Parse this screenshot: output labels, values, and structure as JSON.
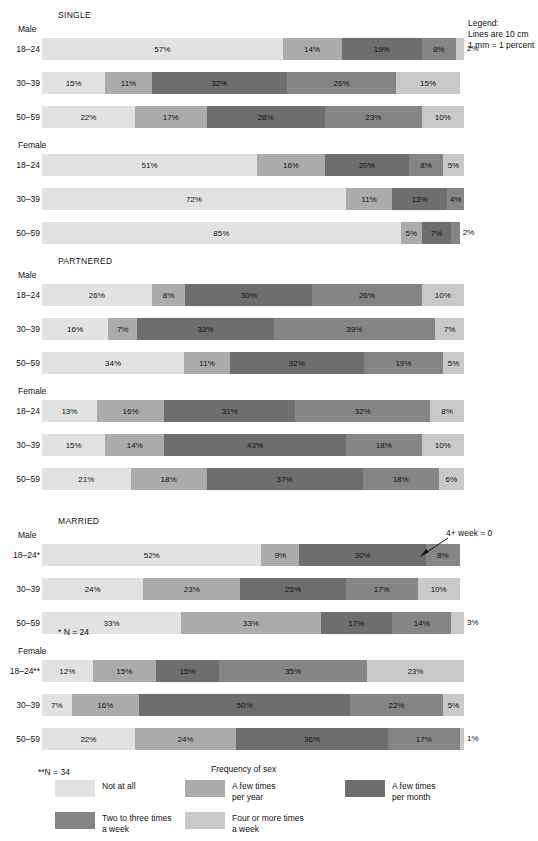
{
  "legend_note": {
    "line1": "Legend:",
    "line2": "Lines are 10 cm",
    "line3": "1 mm = 1 percent"
  },
  "axis_title": "Frequency of sex",
  "footnotes": {
    "male_married": "* N = 24",
    "female_married": "**N = 34"
  },
  "annotation": {
    "text": "4+ week = 0"
  },
  "colors": {
    "not_at_all": "#e2e2e2",
    "few_times_per_year": "#ababab",
    "few_times_per_month": "#6e6e6e",
    "two_to_three_week": "#858585",
    "four_or_more_week": "#c9c9c9"
  },
  "legend": {
    "items": [
      {
        "key": "not_at_all",
        "label": "Not at all"
      },
      {
        "key": "few_times_per_year",
        "label": "A few times\nper year"
      },
      {
        "key": "few_times_per_month",
        "label": "A few times\nper month"
      },
      {
        "key": "two_to_three_week",
        "label": "Two to three times\na week"
      },
      {
        "key": "four_or_more_week",
        "label": "Four or more times\na week"
      }
    ]
  },
  "sections": [
    {
      "title": "SINGLE",
      "subgroups": [
        {
          "sex": "Male",
          "rows": [
            {
              "label": "18–24",
              "segments": [
                {
                  "key": "not_at_all",
                  "value": 57,
                  "text": "57%"
                },
                {
                  "key": "few_times_per_year",
                  "value": 14,
                  "text": "14%"
                },
                {
                  "key": "few_times_per_month",
                  "value": 19,
                  "text": "19%"
                },
                {
                  "key": "two_to_three_week",
                  "value": 8,
                  "text": "8%"
                },
                {
                  "key": "four_or_more_week",
                  "value": 2,
                  "text": "2%"
                }
              ]
            },
            {
              "label": "30–39",
              "segments": [
                {
                  "key": "not_at_all",
                  "value": 15,
                  "text": "15%"
                },
                {
                  "key": "few_times_per_year",
                  "value": 11,
                  "text": "11%"
                },
                {
                  "key": "few_times_per_month",
                  "value": 32,
                  "text": "32%"
                },
                {
                  "key": "two_to_three_week",
                  "value": 26,
                  "text": "26%"
                },
                {
                  "key": "four_or_more_week",
                  "value": 15,
                  "text": "15%"
                }
              ]
            },
            {
              "label": "50–59",
              "segments": [
                {
                  "key": "not_at_all",
                  "value": 22,
                  "text": "22%"
                },
                {
                  "key": "few_times_per_year",
                  "value": 17,
                  "text": "17%"
                },
                {
                  "key": "few_times_per_month",
                  "value": 28,
                  "text": "28%"
                },
                {
                  "key": "two_to_three_week",
                  "value": 23,
                  "text": "23%"
                },
                {
                  "key": "four_or_more_week",
                  "value": 10,
                  "text": "10%"
                }
              ]
            }
          ]
        },
        {
          "sex": "Female",
          "rows": [
            {
              "label": "18–24",
              "segments": [
                {
                  "key": "not_at_all",
                  "value": 51,
                  "text": "51%"
                },
                {
                  "key": "few_times_per_year",
                  "value": 16,
                  "text": "16%"
                },
                {
                  "key": "few_times_per_month",
                  "value": 20,
                  "text": "20%"
                },
                {
                  "key": "two_to_three_week",
                  "value": 8,
                  "text": "8%"
                },
                {
                  "key": "four_or_more_week",
                  "value": 5,
                  "text": "5%"
                }
              ]
            },
            {
              "label": "30–39",
              "segments": [
                {
                  "key": "not_at_all",
                  "value": 72,
                  "text": "72%"
                },
                {
                  "key": "few_times_per_year",
                  "value": 11,
                  "text": "11%"
                },
                {
                  "key": "few_times_per_month",
                  "value": 13,
                  "text": "13%"
                },
                {
                  "key": "two_to_three_week",
                  "value": 4,
                  "text": "4%"
                }
              ]
            },
            {
              "label": "50–59",
              "segments": [
                {
                  "key": "not_at_all",
                  "value": 85,
                  "text": "85%"
                },
                {
                  "key": "few_times_per_year",
                  "value": 5,
                  "text": "5%"
                },
                {
                  "key": "few_times_per_month",
                  "value": 7,
                  "text": "7%"
                },
                {
                  "key": "two_to_three_week",
                  "value": 2,
                  "text": "2%"
                }
              ]
            }
          ]
        }
      ]
    },
    {
      "title": "PARTNERED",
      "subgroups": [
        {
          "sex": "Male",
          "rows": [
            {
              "label": "18–24",
              "segments": [
                {
                  "key": "not_at_all",
                  "value": 26,
                  "text": "26%"
                },
                {
                  "key": "few_times_per_year",
                  "value": 8,
                  "text": "8%"
                },
                {
                  "key": "few_times_per_month",
                  "value": 30,
                  "text": "30%"
                },
                {
                  "key": "two_to_three_week",
                  "value": 26,
                  "text": "26%"
                },
                {
                  "key": "four_or_more_week",
                  "value": 10,
                  "text": "10%"
                }
              ]
            },
            {
              "label": "30–39",
              "segments": [
                {
                  "key": "not_at_all",
                  "value": 16,
                  "text": "16%"
                },
                {
                  "key": "few_times_per_year",
                  "value": 7,
                  "text": "7%"
                },
                {
                  "key": "few_times_per_month",
                  "value": 33,
                  "text": "33%"
                },
                {
                  "key": "two_to_three_week",
                  "value": 39,
                  "text": "39%"
                },
                {
                  "key": "four_or_more_week",
                  "value": 7,
                  "text": "7%"
                }
              ]
            },
            {
              "label": "50–59",
              "segments": [
                {
                  "key": "not_at_all",
                  "value": 34,
                  "text": "34%"
                },
                {
                  "key": "few_times_per_year",
                  "value": 11,
                  "text": "11%"
                },
                {
                  "key": "few_times_per_month",
                  "value": 32,
                  "text": "32%"
                },
                {
                  "key": "two_to_three_week",
                  "value": 19,
                  "text": "19%"
                },
                {
                  "key": "four_or_more_week",
                  "value": 5,
                  "text": "5%"
                }
              ]
            }
          ]
        },
        {
          "sex": "Female",
          "rows": [
            {
              "label": "18–24",
              "segments": [
                {
                  "key": "not_at_all",
                  "value": 13,
                  "text": "13%"
                },
                {
                  "key": "few_times_per_year",
                  "value": 16,
                  "text": "16%"
                },
                {
                  "key": "few_times_per_month",
                  "value": 31,
                  "text": "31%"
                },
                {
                  "key": "two_to_three_week",
                  "value": 32,
                  "text": "32%"
                },
                {
                  "key": "four_or_more_week",
                  "value": 8,
                  "text": "8%"
                }
              ]
            },
            {
              "label": "30–39",
              "segments": [
                {
                  "key": "not_at_all",
                  "value": 15,
                  "text": "15%"
                },
                {
                  "key": "few_times_per_year",
                  "value": 14,
                  "text": "14%"
                },
                {
                  "key": "few_times_per_month",
                  "value": 43,
                  "text": "43%"
                },
                {
                  "key": "two_to_three_week",
                  "value": 18,
                  "text": "18%"
                },
                {
                  "key": "four_or_more_week",
                  "value": 10,
                  "text": "10%"
                }
              ]
            },
            {
              "label": "50–59",
              "segments": [
                {
                  "key": "not_at_all",
                  "value": 21,
                  "text": "21%"
                },
                {
                  "key": "few_times_per_year",
                  "value": 18,
                  "text": "18%"
                },
                {
                  "key": "few_times_per_month",
                  "value": 37,
                  "text": "37%"
                },
                {
                  "key": "two_to_three_week",
                  "value": 18,
                  "text": "18%"
                },
                {
                  "key": "four_or_more_week",
                  "value": 6,
                  "text": "6%"
                }
              ]
            }
          ]
        }
      ]
    },
    {
      "title": "MARRIED",
      "subgroups": [
        {
          "sex": "Male",
          "rows": [
            {
              "label": "18–24*",
              "segments": [
                {
                  "key": "not_at_all",
                  "value": 52,
                  "text": "52%"
                },
                {
                  "key": "few_times_per_year",
                  "value": 9,
                  "text": "9%"
                },
                {
                  "key": "few_times_per_month",
                  "value": 30,
                  "text": "30%"
                },
                {
                  "key": "two_to_three_week",
                  "value": 8,
                  "text": "8%"
                }
              ]
            },
            {
              "label": "30–39",
              "segments": [
                {
                  "key": "not_at_all",
                  "value": 24,
                  "text": "24%"
                },
                {
                  "key": "few_times_per_year",
                  "value": 23,
                  "text": "23%"
                },
                {
                  "key": "few_times_per_month",
                  "value": 25,
                  "text": "25%"
                },
                {
                  "key": "two_to_three_week",
                  "value": 17,
                  "text": "17%"
                },
                {
                  "key": "four_or_more_week",
                  "value": 10,
                  "text": "10%"
                }
              ]
            },
            {
              "label": "50–59",
              "segments": [
                {
                  "key": "not_at_all",
                  "value": 33,
                  "text": "33%"
                },
                {
                  "key": "few_times_per_year",
                  "value": 33,
                  "text": "33%"
                },
                {
                  "key": "few_times_per_month",
                  "value": 17,
                  "text": "17%"
                },
                {
                  "key": "two_to_three_week",
                  "value": 14,
                  "text": "14%"
                },
                {
                  "key": "four_or_more_week",
                  "value": 3,
                  "text": "3%"
                }
              ]
            }
          ]
        },
        {
          "sex": "Female",
          "rows": [
            {
              "label": "18–24**",
              "segments": [
                {
                  "key": "not_at_all",
                  "value": 12,
                  "text": "12%"
                },
                {
                  "key": "few_times_per_year",
                  "value": 15,
                  "text": "15%"
                },
                {
                  "key": "few_times_per_month",
                  "value": 15,
                  "text": "15%"
                },
                {
                  "key": "two_to_three_week",
                  "value": 35,
                  "text": "35%"
                },
                {
                  "key": "four_or_more_week",
                  "value": 23,
                  "text": "23%"
                }
              ]
            },
            {
              "label": "30–39",
              "segments": [
                {
                  "key": "not_at_all",
                  "value": 7,
                  "text": "7%"
                },
                {
                  "key": "few_times_per_year",
                  "value": 16,
                  "text": "16%"
                },
                {
                  "key": "few_times_per_month",
                  "value": 50,
                  "text": "50%"
                },
                {
                  "key": "two_to_three_week",
                  "value": 22,
                  "text": "22%"
                },
                {
                  "key": "four_or_more_week",
                  "value": 5,
                  "text": "5%"
                }
              ]
            },
            {
              "label": "50–59",
              "segments": [
                {
                  "key": "not_at_all",
                  "value": 22,
                  "text": "22%"
                },
                {
                  "key": "few_times_per_year",
                  "value": 24,
                  "text": "24%"
                },
                {
                  "key": "few_times_per_month",
                  "value": 36,
                  "text": "36%"
                },
                {
                  "key": "two_to_three_week",
                  "value": 17,
                  "text": "17%"
                },
                {
                  "key": "four_or_more_week",
                  "value": 1,
                  "text": "1%"
                }
              ]
            }
          ]
        }
      ]
    }
  ],
  "chart_data": {
    "type": "bar",
    "title": "",
    "xlabel": "Frequency of sex",
    "ylabel": "",
    "orientation": "horizontal",
    "stacked": true,
    "xlim": [
      0,
      100
    ],
    "grid": false,
    "legend_position": "bottom",
    "categories": [
      "SINGLE / Male / 18-24",
      "SINGLE / Male / 30-39",
      "SINGLE / Male / 50-59",
      "SINGLE / Female / 18-24",
      "SINGLE / Female / 30-39",
      "SINGLE / Female / 50-59",
      "PARTNERED / Male / 18-24",
      "PARTNERED / Male / 30-39",
      "PARTNERED / Male / 50-59",
      "PARTNERED / Female / 18-24",
      "PARTNERED / Female / 30-39",
      "PARTNERED / Female / 50-59",
      "MARRIED / Male / 18-24*",
      "MARRIED / Male / 30-39",
      "MARRIED / Male / 50-59",
      "MARRIED / Female / 18-24**",
      "MARRIED / Female / 30-39",
      "MARRIED / Female / 50-59"
    ],
    "series": [
      {
        "name": "Not at all",
        "values": [
          57,
          15,
          22,
          51,
          72,
          85,
          26,
          16,
          34,
          13,
          15,
          21,
          52,
          24,
          33,
          12,
          7,
          22
        ]
      },
      {
        "name": "A few times per year",
        "values": [
          14,
          11,
          17,
          16,
          11,
          5,
          8,
          7,
          11,
          16,
          14,
          18,
          9,
          23,
          33,
          15,
          16,
          24
        ]
      },
      {
        "name": "A few times per month",
        "values": [
          19,
          32,
          28,
          20,
          13,
          7,
          30,
          33,
          32,
          31,
          43,
          37,
          30,
          25,
          17,
          15,
          50,
          36
        ]
      },
      {
        "name": "Two to three times a week",
        "values": [
          8,
          26,
          23,
          8,
          4,
          2,
          26,
          39,
          19,
          32,
          18,
          18,
          8,
          17,
          14,
          35,
          22,
          17
        ]
      },
      {
        "name": "Four or more times a week",
        "values": [
          2,
          15,
          10,
          5,
          0,
          0,
          10,
          7,
          5,
          8,
          10,
          6,
          0,
          10,
          3,
          23,
          5,
          1
        ]
      }
    ],
    "annotations": [
      "4+ week = 0",
      "* N = 24",
      "**N = 34",
      "Legend: Lines are 10 cm; 1 mm = 1 percent"
    ]
  }
}
